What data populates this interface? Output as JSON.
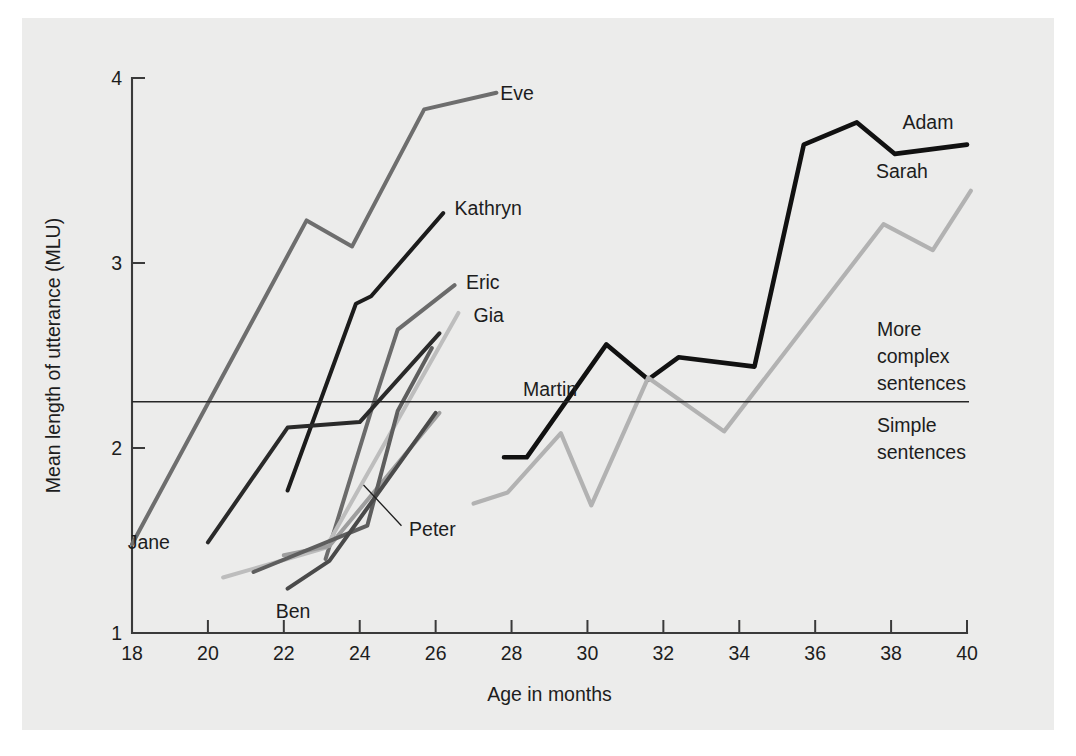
{
  "figure": {
    "background": "#ececeb",
    "page_background": "#ffffff"
  },
  "chart_data": {
    "type": "line",
    "title": "",
    "xlabel": "Age in months",
    "ylabel": "Mean length of utterance (MLU)",
    "xlim": [
      18,
      40
    ],
    "ylim": [
      1,
      4
    ],
    "xticks": [
      18,
      20,
      22,
      24,
      26,
      28,
      30,
      32,
      34,
      36,
      38,
      40
    ],
    "yticks": [
      1,
      2,
      3,
      4
    ],
    "grid": false,
    "legend_position": "inline-end-of-line",
    "annotations": [
      {
        "name": "threshold-line",
        "type": "hline",
        "y": 2.25,
        "label_above": "More complex sentences",
        "label_below": "Simple sentences"
      }
    ],
    "zone_labels": {
      "above": [
        "More",
        "complex",
        "sentences"
      ],
      "below": [
        "Simple",
        "sentences"
      ]
    },
    "series": [
      {
        "name": "Eve",
        "label": "Eve",
        "color": "#6e6e6e",
        "width": 4.0,
        "label_x": 27.7,
        "label_y": 3.92,
        "x": [
          18.0,
          22.6,
          23.8,
          25.7,
          27.6
        ],
        "y": [
          1.48,
          3.23,
          3.09,
          3.83,
          3.92
        ]
      },
      {
        "name": "Kathryn",
        "label": "Kathryn",
        "color": "#1c1c1c",
        "width": 4.0,
        "label_x": 26.5,
        "label_y": 3.3,
        "x": [
          22.1,
          23.9,
          24.3,
          26.2
        ],
        "y": [
          1.77,
          2.78,
          2.82,
          3.27
        ]
      },
      {
        "name": "Eric",
        "label": "Eric",
        "color": "#6b6b6b",
        "width": 4.0,
        "label_x": 26.8,
        "label_y": 2.9,
        "x": [
          23.1,
          24.3,
          25.0,
          26.5
        ],
        "y": [
          1.4,
          2.2,
          2.64,
          2.88
        ]
      },
      {
        "name": "Gia",
        "label": "Gia",
        "color": "#bdbdbd",
        "width": 4.0,
        "label_x": 27.0,
        "label_y": 2.72,
        "x": [
          20.4,
          23.1,
          26.6
        ],
        "y": [
          1.3,
          1.46,
          2.73
        ]
      },
      {
        "name": "Martin",
        "label": "Martin",
        "color": "#9e9e9e",
        "width": 4.0,
        "label_x": 28.3,
        "label_y": 2.32,
        "x": [
          22.0,
          23.2,
          26.1
        ],
        "y": [
          1.42,
          1.47,
          2.19
        ]
      },
      {
        "name": "Jane",
        "label": "Jane",
        "color": "#2a2a2a",
        "width": 4.0,
        "label_x": 19.0,
        "label_y": 1.49,
        "x": [
          20.0,
          22.1,
          24.0,
          26.1
        ],
        "y": [
          1.49,
          2.11,
          2.14,
          2.62
        ]
      },
      {
        "name": "Peter",
        "label": "Peter",
        "color": "#5e5e5e",
        "width": 4.0,
        "label_x": 25.3,
        "label_y": 1.56,
        "x": [
          21.2,
          24.2,
          25.0,
          25.9
        ],
        "y": [
          1.33,
          1.58,
          2.2,
          2.54
        ]
      },
      {
        "name": "Ben",
        "label": "Ben",
        "color": "#4a4a4a",
        "width": 4.0,
        "label_x": 22.7,
        "label_y": 1.12,
        "x": [
          22.1,
          23.2,
          26.0
        ],
        "y": [
          1.24,
          1.39,
          2.19
        ]
      },
      {
        "name": "Adam",
        "label": "Adam",
        "color": "#111111",
        "width": 4.6,
        "label_x": 38.3,
        "label_y": 3.76,
        "x": [
          27.8,
          28.4,
          30.5,
          31.6,
          32.4,
          34.4,
          35.7,
          37.1,
          38.1,
          40.0
        ],
        "y": [
          1.95,
          1.95,
          2.56,
          2.37,
          2.49,
          2.44,
          3.64,
          3.76,
          3.59,
          3.64
        ]
      },
      {
        "name": "Sarah",
        "label": "Sarah",
        "color": "#b2b2b2",
        "width": 4.2,
        "label_x": 37.6,
        "label_y": 3.5,
        "x": [
          27.0,
          27.9,
          29.3,
          30.1,
          31.6,
          33.6,
          37.8,
          39.1,
          40.1
        ],
        "y": [
          1.7,
          1.76,
          2.08,
          1.69,
          2.38,
          2.09,
          3.21,
          3.07,
          3.39
        ]
      }
    ],
    "leader_lines": [
      {
        "name": "peter-leader",
        "from_x": 24.1,
        "from_y": 1.8,
        "to_x": 25.1,
        "to_y": 1.58
      }
    ]
  }
}
